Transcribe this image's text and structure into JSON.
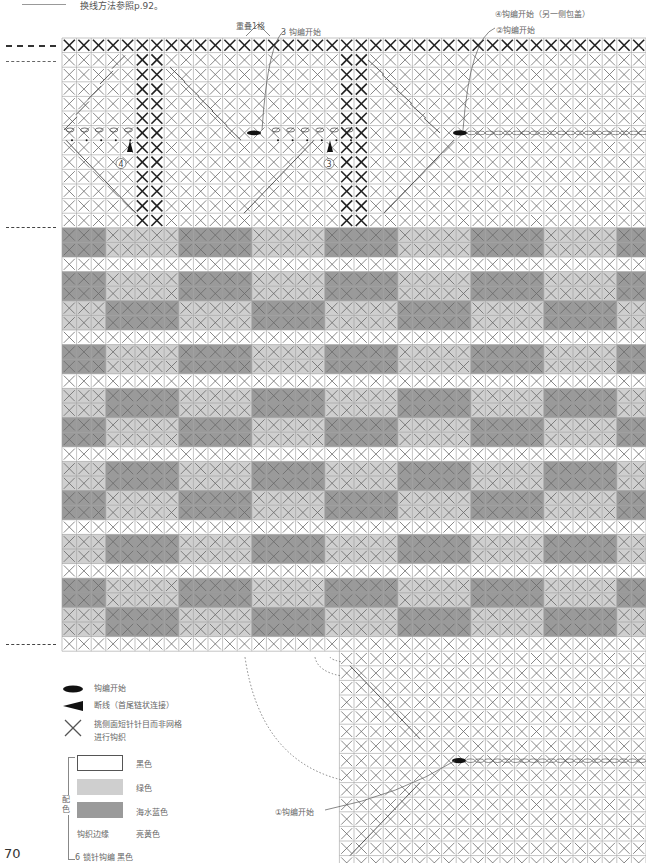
{
  "header": {
    "note": "换线方法参照p.92。"
  },
  "annotations": {
    "overlap": "重叠1格",
    "start3": "3 钩编开始",
    "start4": "④钩编开始（另一侧包盖）",
    "start2": "②钩编开始",
    "start1": "①钩编开始",
    "circle4": "4",
    "circle3": "3"
  },
  "legend": {
    "start_symbol": "钩编开始",
    "cut_symbol": "断线（首尾链状连接）",
    "x_symbol_line1": "挑侧面短针针目而非网格",
    "x_symbol_line2": "进行钩织",
    "color_group_label": "配色",
    "colors": [
      {
        "name": "黑色",
        "hex": "#ffffff"
      },
      {
        "name": "绿色",
        "hex": "#cfcfcf"
      },
      {
        "name": "海水蓝色",
        "hex": "#9a9a9a"
      }
    ],
    "edge_label": "钩织边缘",
    "edge_color": "亮黄色",
    "slip_stitch": "6 锁针钩编 黑色"
  },
  "page_number": "70",
  "colors": {
    "white": "#ffffff",
    "light": "#cfcfcf",
    "dark": "#9a9a9a",
    "grid": "#9c9c9c",
    "cross": "#6a6a6a",
    "cross_bold": "#222222"
  }
}
